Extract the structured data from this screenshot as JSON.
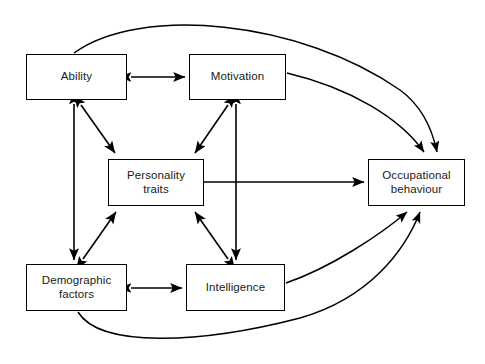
{
  "diagram": {
    "type": "directed-graph",
    "canvas": {
      "width": 485,
      "height": 364,
      "background": "#ffffff"
    },
    "line_color": "#000000",
    "text_color": "#1a1a1a",
    "nodes": [
      {
        "id": "ability",
        "label": "Ability",
        "x": 26,
        "y": 54,
        "w": 101,
        "h": 46
      },
      {
        "id": "motivation",
        "label": "Motivation",
        "x": 189,
        "y": 54,
        "w": 97,
        "h": 46
      },
      {
        "id": "personality",
        "label": "Personality\ntraits",
        "x": 108,
        "y": 159,
        "w": 96,
        "h": 47
      },
      {
        "id": "occupational",
        "label": "Occupational\nbehaviour",
        "x": 368,
        "y": 159,
        "w": 97,
        "h": 47
      },
      {
        "id": "demographic",
        "label": "Demographic\nfactors",
        "x": 26,
        "y": 264,
        "w": 101,
        "h": 47
      },
      {
        "id": "intelligence",
        "label": "Intelligence",
        "x": 186,
        "y": 264,
        "w": 99,
        "h": 47
      }
    ],
    "edges": [
      {
        "id": "ability-motivation",
        "from": "ability",
        "to": "motivation",
        "direction": "bidirectional",
        "shape": "straight"
      },
      {
        "id": "demographic-intelligence",
        "from": "demographic",
        "to": "intelligence",
        "direction": "bidirectional",
        "shape": "straight"
      },
      {
        "id": "ability-demographic",
        "from": "ability",
        "to": "demographic",
        "direction": "bidirectional",
        "shape": "straight"
      },
      {
        "id": "motivation-intelligence",
        "from": "motivation",
        "to": "intelligence",
        "direction": "bidirectional",
        "shape": "straight"
      },
      {
        "id": "ability-personality",
        "from": "ability",
        "to": "personality",
        "direction": "bidirectional",
        "shape": "diagonal"
      },
      {
        "id": "motivation-personality",
        "from": "motivation",
        "to": "personality",
        "direction": "bidirectional",
        "shape": "diagonal"
      },
      {
        "id": "demographic-personality",
        "from": "demographic",
        "to": "personality",
        "direction": "bidirectional",
        "shape": "diagonal"
      },
      {
        "id": "intelligence-personality",
        "from": "intelligence",
        "to": "personality",
        "direction": "bidirectional",
        "shape": "diagonal"
      },
      {
        "id": "personality-occupational",
        "from": "personality",
        "to": "occupational",
        "direction": "unidirectional",
        "shape": "straight"
      },
      {
        "id": "motivation-occupational",
        "from": "motivation",
        "to": "occupational",
        "direction": "unidirectional",
        "shape": "curve"
      },
      {
        "id": "intelligence-occupational",
        "from": "intelligence",
        "to": "occupational",
        "direction": "unidirectional",
        "shape": "straight"
      },
      {
        "id": "ability-occupational",
        "from": "ability",
        "to": "occupational",
        "direction": "unidirectional",
        "shape": "long-curve-top"
      },
      {
        "id": "demographic-occupational",
        "from": "demographic",
        "to": "occupational",
        "direction": "unidirectional",
        "shape": "long-curve-bottom"
      }
    ]
  }
}
